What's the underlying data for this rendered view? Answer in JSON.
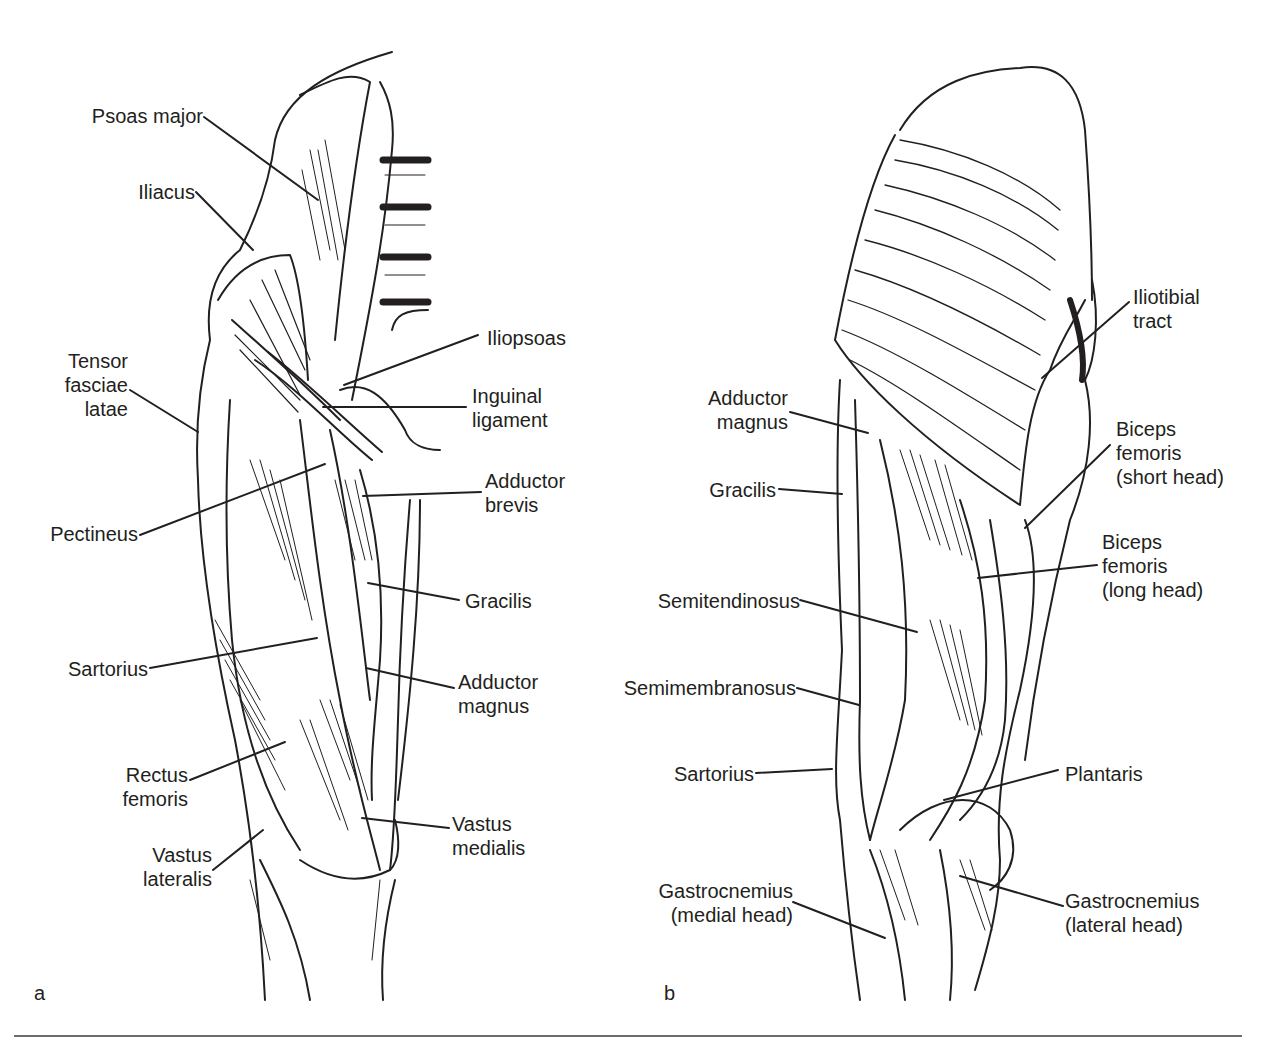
{
  "figure": {
    "panels": [
      {
        "id": "a",
        "letter": "a",
        "view": "anterior thigh",
        "labels": {
          "psoas_major": "Psoas major",
          "iliacus": "Iliacus",
          "tensor_fasciae_latae": "Tensor\nfasciae\nlatae",
          "pectineus": "Pectineus",
          "sartorius": "Sartorius",
          "rectus_femoris": "Rectus\nfemoris",
          "vastus_lateralis": "Vastus\nlateralis",
          "iliopsoas": "Iliopsoas",
          "inguinal_ligament": "Inguinal\nligament",
          "adductor_brevis": "Adductor\nbrevis",
          "gracilis": "Gracilis",
          "adductor_magnus": "Adductor\nmagnus",
          "vastus_medialis": "Vastus\nmedialis"
        }
      },
      {
        "id": "b",
        "letter": "b",
        "view": "posterior thigh",
        "labels": {
          "adductor_magnus": "Adductor\nmagnus",
          "gracilis": "Gracilis",
          "semitendinosus": "Semitendinosus",
          "semimembranosus": "Semimembranosus",
          "sartorius": "Sartorius",
          "gastrocnemius_medial": "Gastrocnemius\n(medial head)",
          "iliotibial_tract": "Iliotibial\ntract",
          "biceps_femoris_short": "Biceps\nfemoris\n(short head)",
          "biceps_femoris_long": "Biceps\nfemoris\n(long head)",
          "plantaris": "Plantaris",
          "gastrocnemius_lateral": "Gastrocnemius\n(lateral head)"
        }
      }
    ],
    "colors": {
      "ink": "#231f20",
      "background": "#ffffff",
      "rule": "#6b6b6b"
    }
  }
}
